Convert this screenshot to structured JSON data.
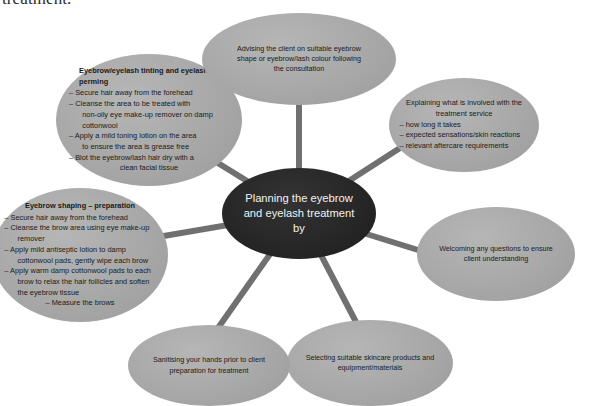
{
  "page": {
    "cut_off_text": "treatment.",
    "colors": {
      "node_fill": "#a9a9a9",
      "center_fill": "#262626",
      "connector": "#707070",
      "text_dark": "#1a1a1a",
      "text_light": "#f2f2f2",
      "background": "#ffffff"
    }
  },
  "diagram": {
    "type": "hub-and-spoke",
    "center": {
      "lines": [
        "Planning the eyebrow",
        "and eyelash treatment",
        "by"
      ]
    },
    "nodes": [
      {
        "id": "tinting-perming",
        "heading": "Eyebrow/eyelash tinting and\neyelash perming",
        "items": [
          "– Secure hair away from the forehead",
          "– Cleanse the area to be treated with\n   non-oily eye make-up remover on damp\n   cottonwool",
          "– Apply a mild toning lotion on the area\n   to ensure the area is grease free",
          "– Blot the eyebrow/lash hair dry with a"
        ],
        "sub_item": "clean facial tissue"
      },
      {
        "id": "advising-client",
        "lines": [
          "Advising the client on suitable eyebrow",
          "shape or eyebrow/lash colour following",
          "the consultation"
        ]
      },
      {
        "id": "explaining-service",
        "heading_lines": [
          "Explaining what is involved with the",
          "treatment service"
        ],
        "items": [
          "– how long it takes",
          "– expected sensations/skin reactions",
          "– relevant aftercare requirements"
        ]
      },
      {
        "id": "welcoming-questions",
        "lines": [
          "Welcoming any questions to ensure",
          "client understanding"
        ]
      },
      {
        "id": "selecting-products",
        "lines": [
          "Selecting suitable skincare products and",
          "equipment/materials"
        ]
      },
      {
        "id": "sanitising-hands",
        "lines": [
          "Sanitising your hands prior to client",
          "preparation for treatment"
        ]
      },
      {
        "id": "eyebrow-shaping",
        "heading": "Eyebrow shaping – preparation",
        "items": [
          "– Secure hair away from the forehead",
          "– Cleanse the brow area using eye make-up\n   remover",
          "– Apply mild antiseptic lotion to damp\n   cottonwool pads, gently wipe each brow",
          "– Apply warm damp cottonwool pads to each\n   brow to relax the hair follicles and soften\n   the eyebrow tissue"
        ],
        "sub_item": "– Measure the brows"
      }
    ]
  }
}
